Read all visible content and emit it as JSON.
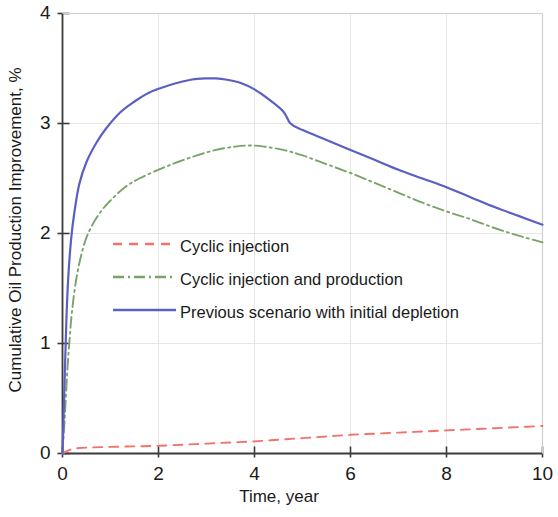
{
  "chart_data": {
    "type": "line",
    "title": "",
    "xlabel": "Time, year",
    "ylabel": "Cumulative Oil Production Improvement, %",
    "xlim": [
      0,
      10
    ],
    "ylim": [
      0,
      4
    ],
    "xticks": [
      0,
      2,
      4,
      6,
      8,
      10
    ],
    "yticks": [
      0,
      1,
      2,
      3,
      4
    ],
    "xtick_labels": [
      "0",
      "2",
      "4",
      "6",
      "8",
      "10"
    ],
    "ytick_labels": [
      "0",
      "1",
      "2",
      "3",
      "4"
    ],
    "grid": true,
    "grid_color": "#e8e6e0",
    "legend_position": "center-left",
    "axis_color": "#3b3b3b",
    "series": [
      {
        "name": "Cyclic injection",
        "color": "#f2736b",
        "style": "dashed",
        "width": 1.9,
        "x": [
          0,
          0.08,
          0.2,
          0.35,
          0.6,
          1.0,
          1.5,
          2.0,
          2.5,
          3.0,
          3.5,
          4.0,
          4.5,
          5.0,
          5.5,
          6.0,
          6.5,
          7.0,
          7.5,
          8.0,
          8.5,
          9.0,
          9.5,
          10.0
        ],
        "y": [
          0,
          0.02,
          0.04,
          0.05,
          0.055,
          0.06,
          0.065,
          0.07,
          0.08,
          0.09,
          0.1,
          0.11,
          0.125,
          0.14,
          0.155,
          0.17,
          0.18,
          0.19,
          0.2,
          0.21,
          0.22,
          0.23,
          0.24,
          0.25
        ]
      },
      {
        "name": "Cyclic injection and production",
        "color": "#7aa36b",
        "style": "dashdot",
        "width": 1.9,
        "x": [
          0,
          0.05,
          0.1,
          0.15,
          0.2,
          0.3,
          0.45,
          0.6,
          0.8,
          1.0,
          1.3,
          1.6,
          2.0,
          2.4,
          2.8,
          3.2,
          3.6,
          3.9,
          4.2,
          4.6,
          5.0,
          5.5,
          6.0,
          6.5,
          7.0,
          7.5,
          8.0,
          8.5,
          9.0,
          9.5,
          10.0
        ],
        "y": [
          0,
          0.35,
          0.75,
          1.05,
          1.3,
          1.62,
          1.9,
          2.06,
          2.2,
          2.3,
          2.42,
          2.5,
          2.58,
          2.65,
          2.71,
          2.76,
          2.79,
          2.8,
          2.79,
          2.76,
          2.71,
          2.63,
          2.55,
          2.46,
          2.37,
          2.28,
          2.2,
          2.13,
          2.05,
          1.98,
          1.92
        ]
      },
      {
        "name": "Previous scenario with initial depletion",
        "color": "#5b5fc2",
        "style": "solid",
        "width": 2.2,
        "x": [
          0,
          0.04,
          0.08,
          0.12,
          0.18,
          0.25,
          0.35,
          0.5,
          0.7,
          0.9,
          1.2,
          1.5,
          1.8,
          2.1,
          2.4,
          2.7,
          3.0,
          3.2,
          3.4,
          3.7,
          4.0,
          4.3,
          4.6,
          4.75,
          5.0,
          5.5,
          6.0,
          6.5,
          7.0,
          7.5,
          8.0,
          8.5,
          9.0,
          9.5,
          10.0
        ],
        "y": [
          0,
          0.6,
          1.2,
          1.6,
          1.95,
          2.2,
          2.45,
          2.65,
          2.82,
          2.95,
          3.1,
          3.2,
          3.28,
          3.33,
          3.37,
          3.4,
          3.41,
          3.41,
          3.4,
          3.37,
          3.31,
          3.22,
          3.11,
          3.0,
          2.94,
          2.85,
          2.76,
          2.67,
          2.58,
          2.5,
          2.42,
          2.33,
          2.24,
          2.16,
          2.08
        ]
      }
    ]
  },
  "legend": {
    "entries": [
      {
        "label": "Cyclic injection"
      },
      {
        "label": "Cyclic injection and production"
      },
      {
        "label": "Previous scenario with initial depletion"
      }
    ]
  }
}
